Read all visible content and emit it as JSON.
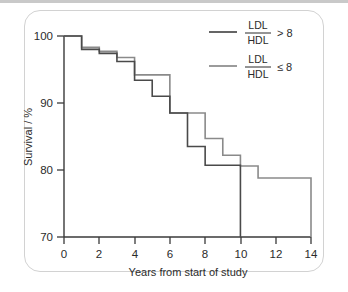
{
  "figure": {
    "frame_style": "rounded-rectangle",
    "top_rule_color": "#c9c9c9",
    "frame_border_color": "#d2d2d2"
  },
  "chart_data": {
    "type": "line",
    "subtype": "kaplan-meier-step",
    "title": "",
    "xlabel": "Years from start of study",
    "ylabel": "Survival / %",
    "xlim": [
      0,
      14
    ],
    "ylim": [
      70,
      100
    ],
    "xticks": [
      0,
      2,
      4,
      6,
      8,
      10,
      12,
      14
    ],
    "xtick_labels": [
      "0",
      "2",
      "4",
      "6",
      "8",
      "10",
      "12",
      "14"
    ],
    "yticks": [
      70,
      80,
      90,
      100
    ],
    "ytick_labels": [
      "70",
      "80",
      "90",
      "100"
    ],
    "grid": false,
    "legend_position": "top-right",
    "series": [
      {
        "name": "LDL/HDL > 8",
        "numerator": "LDL",
        "denominator": "HDL",
        "operator": "> 8",
        "color": "#4a4a4a",
        "line_width": 1.6,
        "steps_x": [
          0,
          1,
          2,
          3,
          4,
          5,
          6,
          7,
          8,
          9,
          10
        ],
        "steps_y": [
          100,
          98,
          97.4,
          96.2,
          93.4,
          91.0,
          88.5,
          83.5,
          80.7,
          80.7,
          80.7
        ],
        "terminates_at_x": 10,
        "terminates_to_y": 70
      },
      {
        "name": "LDL/HDL ≤ 8",
        "numerator": "LDL",
        "denominator": "HDL",
        "operator": "≤ 8",
        "color": "#8a8a8a",
        "line_width": 1.6,
        "steps_x": [
          0,
          1,
          2,
          3,
          4,
          5,
          6,
          7,
          8,
          9,
          10,
          11,
          14
        ],
        "steps_y": [
          100,
          98.3,
          97.7,
          96.8,
          94.2,
          94.2,
          88.5,
          88.5,
          84.7,
          82.2,
          80.6,
          78.8,
          75.3
        ],
        "terminates_at_x": 14,
        "terminates_to_y": 70
      }
    ]
  },
  "legend": {
    "entries": [
      {
        "numerator": "LDL",
        "denominator": "HDL",
        "operator": "> 8",
        "swatch_color": "#4a4a4a"
      },
      {
        "numerator": "LDL",
        "denominator": "HDL",
        "operator": "≤ 8",
        "swatch_color": "#8a8a8a"
      }
    ]
  }
}
